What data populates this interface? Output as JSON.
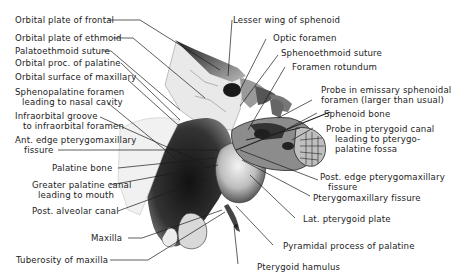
{
  "figure": {
    "left_labels": [
      {
        "id": "orbital-plate-frontal",
        "text": "Orbital plate of frontal"
      },
      {
        "id": "orbital-plate-ethmoid",
        "text": "Orbital plate of ethmoid"
      },
      {
        "id": "palatoethmoid-suture",
        "text": "Palatoethmoid suture"
      },
      {
        "id": "orbital-proc-palatine",
        "text": "Orbital proc. of palatine"
      },
      {
        "id": "orbital-surface-maxillary",
        "text": "Orbital surface of maxillary"
      },
      {
        "id": "sphenopalatine-foramen",
        "line1": "Sphenopalatine foramen",
        "line2": "leading to nasal cavity"
      },
      {
        "id": "infraorbital-groove",
        "line1": "Infraorbital groove",
        "line2": "to infraorbital foramen"
      },
      {
        "id": "ant-edge-pterygomaxillary",
        "line1": "Ant. edge pterygomaxillary",
        "line2": "fissure"
      },
      {
        "id": "palatine-bone",
        "text": "Palatine bone"
      },
      {
        "id": "greater-palatine-canal",
        "line1": "Greater palatine canal",
        "line2": "leading to mouth"
      },
      {
        "id": "post-alveolar-canal",
        "text": "Post. alveolar canal"
      },
      {
        "id": "maxilla",
        "text": "Maxilla"
      },
      {
        "id": "tuberosity-maxilla",
        "text": "Tuberosity of maxilla"
      }
    ],
    "right_labels": [
      {
        "id": "lesser-wing-sphenoid",
        "text": "Lesser wing of sphenoid"
      },
      {
        "id": "optic-foramen",
        "text": "Optic foramen"
      },
      {
        "id": "sphenoethmoid-suture",
        "text": "Sphenoethmoid suture"
      },
      {
        "id": "foramen-rotundum",
        "text": "Foramen rotundum"
      },
      {
        "id": "probe-emissary",
        "line1": "Probe in emissary sphenoidal",
        "line2": "foramen (larger than usual)"
      },
      {
        "id": "sphenoid-bone",
        "text": "Sphenoid bone"
      },
      {
        "id": "probe-pterygoid-canal",
        "line1": "Probe in pterygoid canal",
        "line2": "leading to pterygo-",
        "line3": "palatine fossa"
      },
      {
        "id": "post-edge-pterygomaxillary",
        "line1": "Post. edge pterygomaxillary",
        "line2": "fissure"
      },
      {
        "id": "pterygomaxillary-fissure",
        "text": "Pterygomaxillary fissure"
      },
      {
        "id": "lat-pterygoid-plate",
        "text": "Lat. pterygoid plate"
      },
      {
        "id": "pyramidal-process",
        "text": "Pyramidal process of palatine"
      },
      {
        "id": "pterygoid-hamulus",
        "text": "Pterygoid hamulus"
      }
    ],
    "colors": {
      "ink": "#1a1a1a",
      "paper": "#ffffff",
      "shade_dark": "#2a2a2a",
      "shade_mid": "#8a8a8a",
      "shade_light": "#d8d8d8"
    }
  }
}
